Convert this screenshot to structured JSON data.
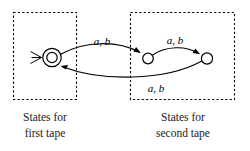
{
  "figure": {
    "groups": [
      {
        "id": "first-tape",
        "caption_line1": "States for",
        "caption_line2": "first tape"
      },
      {
        "id": "second-tape",
        "caption_line1": "States for",
        "caption_line2": "second tape"
      }
    ],
    "states": [
      {
        "id": "q0",
        "type": "accept-start",
        "group": "first-tape"
      },
      {
        "id": "q1",
        "type": "plain",
        "group": "second-tape"
      },
      {
        "id": "q2",
        "type": "plain",
        "group": "second-tape"
      }
    ],
    "transitions": [
      {
        "id": "t1",
        "from": "q0",
        "to": "q1",
        "label": "a, b"
      },
      {
        "id": "t2",
        "from": "q1",
        "to": "q2",
        "label": "a, b"
      },
      {
        "id": "t3",
        "from": "q2",
        "to": "q0",
        "label": "a, b"
      }
    ],
    "labels": {
      "edge_top_left": "a, b",
      "edge_top_right": "a, b",
      "edge_bottom": "a, b"
    },
    "colors": {
      "ink": "#000000",
      "caption": "#1a1a1a",
      "background": "#ffffff"
    }
  }
}
